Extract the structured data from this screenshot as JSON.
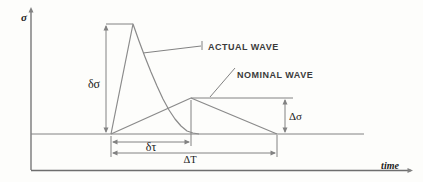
{
  "figure": {
    "colors": {
      "background": "#fdfdfb",
      "line": "#828282",
      "axis": "#6e6e6e",
      "wave": "#8a8a8a",
      "wave_label_text": "#3a3a3a",
      "greek_text": "#1a1a1a"
    }
  },
  "labels": {
    "sigma_axis": "σ",
    "time_axis": "time",
    "actual": "ACTUAL WAVE",
    "nominal": "NOMINAL WAVE",
    "delta_sigma": "δσ",
    "delta_tau": "δτ",
    "delta_t": "ΔT",
    "cap_delta_sigma": "Δσ"
  },
  "geometry": {
    "lines": [
      {
        "name": "y-axis",
        "x1": 31,
        "y1": 170,
        "x2": 31,
        "y2": 9,
        "w": 1.3
      },
      {
        "name": "x-axis",
        "x1": 31,
        "y1": 170.5,
        "x2": 411,
        "y2": 170.5,
        "w": 1.3
      },
      {
        "name": "baseline",
        "x1": 31,
        "y1": 134,
        "x2": 364,
        "y2": 134,
        "w": 1
      },
      {
        "name": "dsigma-cap",
        "x1": 106,
        "y1": 24,
        "x2": 133,
        "y2": 24,
        "w": 1
      },
      {
        "name": "dsigma-dim",
        "x1": 106,
        "y1": 26,
        "x2": 106,
        "y2": 132,
        "w": 1
      },
      {
        "name": "Dsigma-ext",
        "x1": 191,
        "y1": 98,
        "x2": 293,
        "y2": 98,
        "w": 1
      },
      {
        "name": "Dsigma-dim",
        "x1": 285,
        "y1": 100,
        "x2": 285,
        "y2": 132,
        "w": 1
      },
      {
        "name": "dtau-dim",
        "x1": 113,
        "y1": 142,
        "x2": 189,
        "y2": 142,
        "w": 1
      },
      {
        "name": "DT-dim",
        "x1": 113,
        "y1": 153,
        "x2": 275,
        "y2": 153,
        "w": 1
      },
      {
        "name": "ext-left",
        "x1": 111,
        "y1": 136,
        "x2": 111,
        "y2": 157,
        "w": 1
      },
      {
        "name": "ext-mid",
        "x1": 191,
        "y1": 100,
        "x2": 191,
        "y2": 146,
        "w": 1
      },
      {
        "name": "ext-right",
        "x1": 277,
        "y1": 135,
        "x2": 277,
        "y2": 157,
        "w": 1
      },
      {
        "name": "leader-actual",
        "x1": 143,
        "y1": 53,
        "x2": 201,
        "y2": 46,
        "w": 1
      },
      {
        "name": "leader-actual-tick",
        "x1": 202,
        "y1": 41,
        "x2": 202,
        "y2": 50,
        "w": 1
      },
      {
        "name": "leader-nominal",
        "x1": 210,
        "y1": 97,
        "x2": 235,
        "y2": 68,
        "w": 1
      }
    ],
    "polylines": [
      {
        "name": "actual-wave",
        "w": 1.2,
        "points": [
          [
            111,
            134
          ],
          [
            133,
            24
          ],
          [
            139,
            41
          ],
          [
            145,
            57
          ],
          [
            151,
            72
          ],
          [
            157,
            86
          ],
          [
            163,
            99
          ],
          [
            169,
            110
          ],
          [
            175,
            119
          ],
          [
            181,
            126
          ],
          [
            187,
            131
          ],
          [
            193,
            133
          ],
          [
            199,
            134
          ]
        ]
      },
      {
        "name": "nominal-wave",
        "w": 1.2,
        "points": [
          [
            111,
            134
          ],
          [
            191,
            98
          ],
          [
            277,
            134
          ]
        ]
      }
    ],
    "arrowheads": [
      {
        "x": 31,
        "y": 7,
        "dir": "up"
      },
      {
        "x": 413,
        "y": 170.5,
        "dir": "right"
      },
      {
        "x": 106,
        "y": 25,
        "dir": "up"
      },
      {
        "x": 106,
        "y": 133,
        "dir": "down"
      },
      {
        "x": 285,
        "y": 99,
        "dir": "up"
      },
      {
        "x": 285,
        "y": 133,
        "dir": "down"
      },
      {
        "x": 112,
        "y": 142,
        "dir": "left"
      },
      {
        "x": 190,
        "y": 142,
        "dir": "right"
      },
      {
        "x": 112,
        "y": 153,
        "dir": "left"
      },
      {
        "x": 276,
        "y": 153,
        "dir": "right"
      }
    ]
  }
}
